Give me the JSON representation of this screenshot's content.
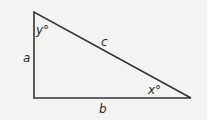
{
  "diagram": {
    "type": "right-triangle",
    "background": "#f3f3f1",
    "stroke_color": "#333333",
    "vertices": {
      "top": [
        34,
        12
      ],
      "right_angle": [
        34,
        98
      ],
      "right": [
        191,
        98
      ]
    },
    "labels": {
      "side_vertical": "a",
      "side_horizontal": "b",
      "hypotenuse": "c",
      "angle_top": "y°",
      "angle_right": "x°"
    }
  }
}
